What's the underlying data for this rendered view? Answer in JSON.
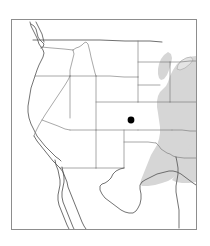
{
  "figure": {
    "type": "distribution-map",
    "region": "Western and Central United States",
    "title": "",
    "caption": "",
    "width_px": 210,
    "height_px": 246
  },
  "frame": {
    "x": 11,
    "y": 19,
    "width": 186,
    "height": 211,
    "border_color": "#8d8d8d",
    "background_color": "#ffffff"
  },
  "legend": {
    "items": [
      {
        "name": "locality-point",
        "label": "",
        "symbol": "filled-circle",
        "color": "#000000"
      },
      {
        "name": "shaded-range",
        "label": "",
        "symbol": "shaded-area",
        "color": "#d6d6d6"
      }
    ]
  },
  "markers": [
    {
      "name": "locality-dot",
      "label": "",
      "state": "Colorado",
      "x": 131,
      "y": 120,
      "radius": 3.4,
      "color": "#000000"
    }
  ],
  "shaded_range": {
    "name": "eastern-shaded-range",
    "label": "",
    "color": "#d6d6d6",
    "states": [
      "Minnesota",
      "Iowa",
      "Missouri",
      "Arkansas",
      "Louisiana",
      "Eastern Texas",
      "Wisconsin",
      "Illinois"
    ]
  },
  "water_bodies": [
    {
      "name": "lake-superior",
      "label": "",
      "color": "#e4e4e4"
    }
  ],
  "map_colors": {
    "state_border": "#7a7a7a",
    "country_border": "#555555",
    "coastline": "#5a5a5a",
    "land": "#ffffff",
    "shading": "#d6d6d6",
    "frame": "#8d8d8d"
  }
}
